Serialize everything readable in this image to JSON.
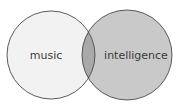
{
  "diagram": {
    "type": "venn",
    "sets": [
      {
        "label": "music",
        "fill": "#f2f2f2"
      },
      {
        "label": "intelligence",
        "fill": "#c9c9c9"
      }
    ],
    "intersection_fill": "#a9a9a9",
    "stroke": "#4a4a4a"
  }
}
